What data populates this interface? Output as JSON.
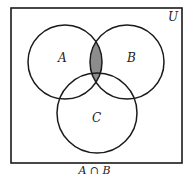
{
  "diagram": {
    "type": "venn",
    "universe_label": "U",
    "sets": [
      {
        "label": "A",
        "cx": 65,
        "cy": 62,
        "r": 37
      },
      {
        "label": "B",
        "cx": 127,
        "cy": 62,
        "r": 37
      },
      {
        "label": "C",
        "cx": 97,
        "cy": 113,
        "r": 40
      }
    ],
    "shaded_region": "A ∩ B",
    "shade_color": "#8c8c8c",
    "stroke_color": "#1a1a1a",
    "caption": "A ∩ B"
  }
}
